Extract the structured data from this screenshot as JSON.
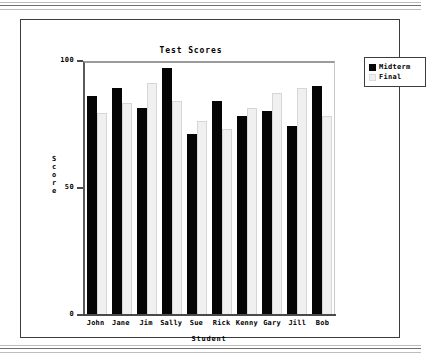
{
  "chart_data": {
    "type": "bar",
    "title": "Test Scores",
    "xlabel": "Student",
    "ylabel": "Score",
    "categories": [
      "John",
      "Jane",
      "Jim",
      "Sally",
      "Sue",
      "Rick",
      "Kenny",
      "Gary",
      "Jill",
      "Bob"
    ],
    "series": [
      {
        "name": "Midterm",
        "color": "#050505",
        "values": [
          87,
          90,
          82,
          98,
          72,
          85,
          79,
          81,
          75,
          91
        ]
      },
      {
        "name": "Final",
        "color": "#f0f0f0",
        "values": [
          80,
          84,
          92,
          85,
          77,
          74,
          82,
          88,
          90,
          79
        ]
      }
    ],
    "ylim": [
      0,
      100
    ],
    "yticks": [
      "0",
      "50",
      "100"
    ],
    "grid": false,
    "legend_position": "right-outside"
  },
  "legend": {
    "entries": [
      {
        "label": "Midterm"
      },
      {
        "label": "Final"
      }
    ]
  }
}
